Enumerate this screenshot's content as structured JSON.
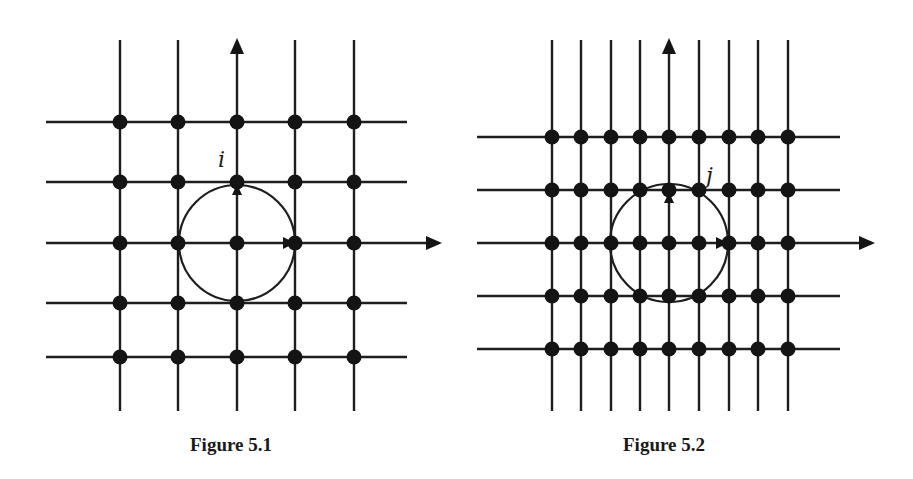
{
  "figures": [
    {
      "caption": "Figure 5.1",
      "label": "i",
      "caption_x": 190,
      "verticals": [
        120,
        178,
        237,
        295,
        354
      ],
      "horizontals": [
        122,
        182,
        243,
        303,
        357
      ],
      "v_span": [
        40,
        411
      ],
      "h_span": [
        46,
        407
      ],
      "center": [
        237,
        243
      ],
      "radius": 58,
      "axis_y_tip": 38,
      "axis_x_tip": 442,
      "label_pos": [
        218,
        167
      ],
      "node_radius": 7.5
    },
    {
      "caption": "Figure 5.2",
      "label": "j",
      "caption_x": 623,
      "verticals": [
        552,
        581,
        611,
        640,
        669,
        699,
        729,
        758,
        788
      ],
      "horizontals": [
        137,
        190,
        243,
        296,
        349
      ],
      "v_span": [
        40,
        411
      ],
      "h_span": [
        477,
        840
      ],
      "center": [
        669,
        243
      ],
      "radius": 59,
      "axis_y_tip": 38,
      "axis_x_tip": 875,
      "label_pos": [
        706,
        183
      ],
      "node_radius": 7.5
    }
  ],
  "colors": {
    "ink": "#141414",
    "paper": "#ffffff"
  }
}
